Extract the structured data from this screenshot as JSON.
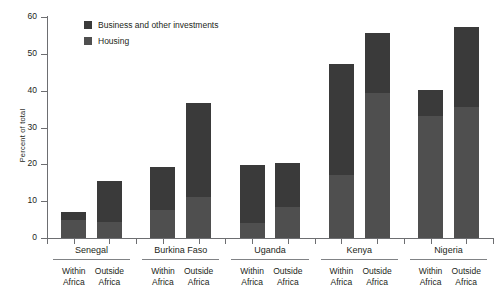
{
  "chart_data": {
    "type": "bar",
    "subtype": "stacked-bar",
    "title": "",
    "xlabel": "",
    "ylabel": "Percent of total",
    "ylim": [
      0,
      60
    ],
    "yticks": [
      0,
      10,
      20,
      30,
      40,
      50,
      60
    ],
    "grid": false,
    "legend_position": "top-left",
    "groups": [
      "Senegal",
      "Burkina Faso",
      "Uganda",
      "Kenya",
      "Nigeria"
    ],
    "subgroups": [
      "Within Africa",
      "Outside Africa"
    ],
    "categories": [
      "Senegal Within Africa",
      "Senegal Outside Africa",
      "Burkina Faso Within Africa",
      "Burkina Faso Outside Africa",
      "Uganda Within Africa",
      "Uganda Outside Africa",
      "Kenya Within Africa",
      "Kenya Outside Africa",
      "Nigeria Within Africa",
      "Nigeria Outside Africa"
    ],
    "series": [
      {
        "name": "Housing",
        "color": "#4f4f4f",
        "values": [
          5.0,
          4.4,
          7.6,
          11.0,
          4.0,
          8.4,
          17.2,
          39.4,
          33.0,
          35.6
        ]
      },
      {
        "name": "Business and other investments",
        "color": "#3a3a3a",
        "values": [
          2.2,
          11.2,
          11.6,
          25.6,
          15.7,
          12.1,
          30.0,
          16.2,
          7.2,
          21.8
        ]
      }
    ],
    "totals": [
      7.2,
      15.6,
      19.2,
      36.6,
      19.7,
      20.5,
      47.2,
      55.6,
      40.2,
      57.4
    ]
  },
  "legend": {
    "items": [
      {
        "label": "Business and other investments",
        "key": "biz"
      },
      {
        "label": "Housing",
        "key": "hou"
      }
    ]
  },
  "axes": {
    "y_label": "Percent of total",
    "y_ticks": [
      "60",
      "50",
      "40",
      "30",
      "20",
      "10",
      "0"
    ]
  },
  "groups": [
    {
      "name": "Senegal",
      "sub": [
        "Within Africa",
        "Outside Africa"
      ]
    },
    {
      "name": "Burkina Faso",
      "sub": [
        "Within Africa",
        "Outside Africa"
      ]
    },
    {
      "name": "Uganda",
      "sub": [
        "Within Africa",
        "Outside Africa"
      ]
    },
    {
      "name": "Kenya",
      "sub": [
        "Within Africa",
        "Outside Africa"
      ]
    },
    {
      "name": "Nigeria",
      "sub": [
        "Within Africa",
        "Outside Africa"
      ]
    }
  ],
  "sub_lines": {
    "within_1": "Within",
    "within_2": "Africa",
    "outside_1": "Outside",
    "outside_2": "Africa"
  }
}
